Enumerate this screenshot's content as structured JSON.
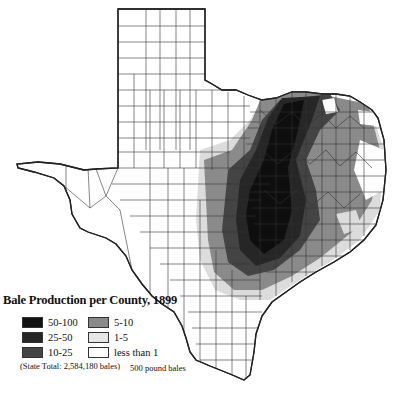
{
  "title": "Bale Production per County, 1899",
  "legend": {
    "items": [
      {
        "label": "50-100",
        "color": "#111111"
      },
      {
        "label": "25-50",
        "color": "#262626"
      },
      {
        "label": "10-25",
        "color": "#444444"
      },
      {
        "label": "5-10",
        "color": "#8a8a8a"
      },
      {
        "label": "1-5",
        "color": "#dcdcdc"
      },
      {
        "label": "less than 1",
        "color": "#ffffff"
      }
    ]
  },
  "notes": {
    "state_total": "(State Total: 2,584,180 bales)",
    "unit": "500 pound bales"
  }
}
